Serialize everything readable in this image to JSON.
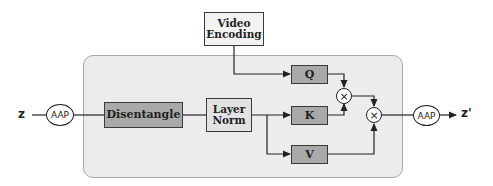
{
  "diagram": {
    "input_label": "z",
    "output_label": "z'",
    "input_pool": "AAP",
    "output_pool": "AAP",
    "video_encoding": {
      "line1": "Video",
      "line2": "Encoding"
    },
    "disentangle": "Disentangle",
    "layer_norm": {
      "line1": "Layer",
      "line2": "Norm"
    },
    "query": "Q",
    "key": "K",
    "value": "V",
    "multiply_symbol": "×"
  },
  "colors": {
    "container_fill": "#ececec",
    "dark_box_fill": "#a9a9a9",
    "light_box_fill": "#e2e2e2",
    "stroke": "#222222"
  }
}
